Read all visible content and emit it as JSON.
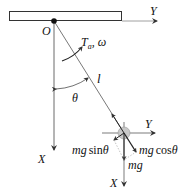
{
  "diagram": {
    "labels": {
      "pivot": "O",
      "top_axis_y": "Y",
      "left_axis_x": "X",
      "torque_omega_T": "T",
      "torque_omega_sub": "a",
      "torque_omega_rest": ", ω",
      "length": "l",
      "angle": "θ",
      "bob_axis_y": "Y",
      "bob_axis_x": "X",
      "force_sin_mg": "mg",
      "force_sin_fn": "sin",
      "force_sin_theta": "θ",
      "force_cos_mg": "mg",
      "force_cos_fn": "cos",
      "force_cos_theta": "θ",
      "weight": "mg"
    },
    "colors": {
      "line": "#333333",
      "bob_fill": "#c8c8c8",
      "bob_stroke": "#999999"
    }
  }
}
